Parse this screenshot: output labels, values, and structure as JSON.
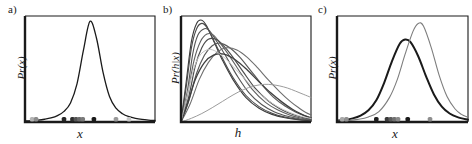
{
  "figure": {
    "width": 472,
    "height": 144,
    "background": "#ffffff",
    "axis_color": "#1a1a1a"
  },
  "panels": [
    {
      "key": "a",
      "label": "a)",
      "xlabel": "x",
      "ylabel": "Pr(x)"
    },
    {
      "key": "b",
      "label": "b)",
      "xlabel": "h",
      "ylabel": "Pr(h|x)"
    },
    {
      "key": "c",
      "label": "c)",
      "xlabel": "x",
      "ylabel": "Pr(x)"
    }
  ],
  "chart_data": [
    {
      "type": "line",
      "panel": "a",
      "title": "a)",
      "xlabel": "x",
      "ylabel": "Pr(x)",
      "xlim": [
        0,
        1
      ],
      "ylim": [
        0,
        1
      ],
      "grid": false,
      "legend": "none",
      "series": [
        {
          "name": "marginal-density",
          "color": "#1a1a1a",
          "width": 1.3,
          "x": [
            0.0,
            0.05,
            0.1,
            0.15,
            0.2,
            0.25,
            0.3,
            0.35,
            0.4,
            0.45,
            0.5,
            0.55,
            0.6,
            0.65,
            0.7,
            0.75,
            0.8,
            0.85,
            0.9,
            0.95,
            1.0
          ],
          "y": [
            0.01,
            0.013,
            0.018,
            0.026,
            0.038,
            0.06,
            0.1,
            0.18,
            0.36,
            0.68,
            0.95,
            0.79,
            0.47,
            0.24,
            0.13,
            0.078,
            0.05,
            0.034,
            0.024,
            0.018,
            0.014
          ]
        }
      ],
      "rug_points": [
        {
          "x": 0.055,
          "shade": "#b4b4b4"
        },
        {
          "x": 0.085,
          "shade": "#8c8c8c"
        },
        {
          "x": 0.3,
          "shade": "#262626"
        },
        {
          "x": 0.365,
          "shade": "#2e2e2e"
        },
        {
          "x": 0.392,
          "shade": "#555555"
        },
        {
          "x": 0.418,
          "shade": "#6b6b6b"
        },
        {
          "x": 0.444,
          "shade": "#7a7a7a"
        },
        {
          "x": 0.53,
          "shade": "#1a1a1a"
        },
        {
          "x": 0.7,
          "shade": "#9a9a9a"
        },
        {
          "x": 0.8,
          "shade": "#c8c8c8"
        }
      ]
    },
    {
      "type": "line",
      "panel": "b",
      "title": "b)",
      "xlabel": "h",
      "ylabel": "Pr(h|x)",
      "xlim": [
        0,
        1
      ],
      "ylim": [
        0,
        1
      ],
      "grid": false,
      "legend": "none",
      "series": [
        {
          "name": "posterior-1",
          "color": "#3c3c3c",
          "width": 1.1,
          "x": [
            0.0,
            0.04,
            0.08,
            0.12,
            0.16,
            0.2,
            0.26,
            0.32,
            0.4,
            0.5,
            0.6,
            0.7,
            0.8,
            0.9,
            1.0
          ],
          "y": [
            0.0,
            0.38,
            0.76,
            0.93,
            0.96,
            0.9,
            0.74,
            0.58,
            0.4,
            0.23,
            0.13,
            0.072,
            0.04,
            0.022,
            0.012
          ]
        },
        {
          "name": "posterior-2",
          "color": "#4a4a4a",
          "width": 1.1,
          "x": [
            0.0,
            0.04,
            0.08,
            0.12,
            0.16,
            0.2,
            0.26,
            0.32,
            0.4,
            0.5,
            0.6,
            0.7,
            0.8,
            0.9,
            1.0
          ],
          "y": [
            0.0,
            0.33,
            0.7,
            0.88,
            0.93,
            0.89,
            0.75,
            0.6,
            0.42,
            0.25,
            0.145,
            0.082,
            0.046,
            0.026,
            0.014
          ]
        },
        {
          "name": "posterior-3",
          "color": "#555555",
          "width": 1.1,
          "x": [
            0.0,
            0.05,
            0.09,
            0.13,
            0.18,
            0.22,
            0.28,
            0.35,
            0.43,
            0.52,
            0.62,
            0.72,
            0.82,
            0.91,
            1.0
          ],
          "y": [
            0.0,
            0.3,
            0.64,
            0.82,
            0.88,
            0.86,
            0.75,
            0.61,
            0.44,
            0.28,
            0.165,
            0.095,
            0.054,
            0.031,
            0.018
          ]
        },
        {
          "name": "posterior-4",
          "color": "#606060",
          "width": 1.1,
          "x": [
            0.0,
            0.05,
            0.1,
            0.15,
            0.2,
            0.25,
            0.31,
            0.38,
            0.46,
            0.55,
            0.65,
            0.75,
            0.84,
            0.92,
            1.0
          ],
          "y": [
            0.0,
            0.26,
            0.58,
            0.76,
            0.83,
            0.82,
            0.73,
            0.61,
            0.46,
            0.305,
            0.185,
            0.11,
            0.064,
            0.038,
            0.022
          ]
        },
        {
          "name": "posterior-5",
          "color": "#4e4e4e",
          "width": 1.2,
          "x": [
            0.0,
            0.06,
            0.11,
            0.16,
            0.21,
            0.27,
            0.33,
            0.4,
            0.48,
            0.57,
            0.67,
            0.76,
            0.85,
            0.93,
            1.0
          ],
          "y": [
            0.0,
            0.24,
            0.53,
            0.7,
            0.78,
            0.78,
            0.715,
            0.61,
            0.47,
            0.32,
            0.2,
            0.125,
            0.075,
            0.045,
            0.027
          ]
        },
        {
          "name": "posterior-6",
          "color": "#5a5a5a",
          "width": 1.2,
          "x": [
            0.0,
            0.06,
            0.12,
            0.18,
            0.24,
            0.3,
            0.37,
            0.45,
            0.53,
            0.62,
            0.71,
            0.8,
            0.88,
            0.95,
            1.0
          ],
          "y": [
            0.0,
            0.2,
            0.46,
            0.63,
            0.72,
            0.745,
            0.705,
            0.615,
            0.495,
            0.355,
            0.235,
            0.15,
            0.095,
            0.06,
            0.042
          ]
        },
        {
          "name": "posterior-7",
          "color": "#6e6e6e",
          "width": 1.1,
          "x": [
            0.0,
            0.07,
            0.14,
            0.21,
            0.28,
            0.35,
            0.43,
            0.51,
            0.59,
            0.67,
            0.76,
            0.84,
            0.91,
            0.96,
            1.0
          ],
          "y": [
            0.0,
            0.17,
            0.4,
            0.56,
            0.66,
            0.7,
            0.68,
            0.61,
            0.51,
            0.4,
            0.285,
            0.195,
            0.13,
            0.09,
            0.068
          ]
        },
        {
          "name": "posterior-8",
          "color": "#3f3f3f",
          "width": 1.3,
          "x": [
            0.0,
            0.05,
            0.11,
            0.18,
            0.25,
            0.33,
            0.42,
            0.51,
            0.6,
            0.69,
            0.78,
            0.86,
            0.93,
            0.97,
            1.0
          ],
          "y": [
            0.0,
            0.17,
            0.4,
            0.56,
            0.63,
            0.64,
            0.585,
            0.49,
            0.38,
            0.275,
            0.185,
            0.118,
            0.072,
            0.05,
            0.038
          ]
        },
        {
          "name": "posterior-broad",
          "color": "#9c9c9c",
          "width": 1.0,
          "x": [
            0.0,
            0.08,
            0.16,
            0.24,
            0.32,
            0.4,
            0.48,
            0.56,
            0.64,
            0.7,
            0.76,
            0.82,
            0.88,
            0.94,
            1.0
          ],
          "y": [
            0.0,
            0.035,
            0.08,
            0.135,
            0.195,
            0.255,
            0.305,
            0.34,
            0.355,
            0.352,
            0.34,
            0.32,
            0.292,
            0.262,
            0.232
          ]
        },
        {
          "name": "posterior-faint",
          "color": "#c4c4c4",
          "width": 1.0,
          "x": [
            0.0,
            0.04,
            0.09,
            0.14,
            0.2,
            0.26,
            0.34,
            0.42,
            0.51,
            0.6,
            0.7,
            0.79,
            0.88,
            0.95,
            1.0
          ],
          "y": [
            0.0,
            0.21,
            0.47,
            0.62,
            0.68,
            0.672,
            0.6,
            0.498,
            0.38,
            0.272,
            0.178,
            0.115,
            0.07,
            0.046,
            0.034
          ]
        }
      ]
    },
    {
      "type": "line",
      "panel": "c",
      "title": "c)",
      "xlabel": "x",
      "ylabel": "Pr(x)",
      "xlim": [
        0,
        1
      ],
      "ylim": [
        0,
        1
      ],
      "grid": false,
      "legend": "none",
      "series": [
        {
          "name": "predictive-dark",
          "color": "#1a1a1a",
          "width": 2.0,
          "x": [
            0.0,
            0.06,
            0.12,
            0.18,
            0.24,
            0.3,
            0.36,
            0.42,
            0.48,
            0.52,
            0.56,
            0.62,
            0.68,
            0.74,
            0.8,
            0.86,
            0.92,
            1.0
          ],
          "y": [
            0.012,
            0.02,
            0.034,
            0.06,
            0.11,
            0.205,
            0.37,
            0.575,
            0.74,
            0.778,
            0.755,
            0.62,
            0.43,
            0.26,
            0.145,
            0.08,
            0.046,
            0.022
          ]
        },
        {
          "name": "predictive-gray",
          "color": "#7d7d7d",
          "width": 1.1,
          "x": [
            0.0,
            0.08,
            0.16,
            0.24,
            0.32,
            0.4,
            0.46,
            0.52,
            0.58,
            0.62,
            0.66,
            0.72,
            0.78,
            0.84,
            0.9,
            0.95,
            1.0
          ],
          "y": [
            0.008,
            0.014,
            0.025,
            0.048,
            0.098,
            0.23,
            0.4,
            0.64,
            0.855,
            0.93,
            0.905,
            0.7,
            0.44,
            0.24,
            0.125,
            0.072,
            0.044
          ]
        }
      ],
      "rug_points": [
        {
          "x": 0.04,
          "shade": "#a8a8a8"
        },
        {
          "x": 0.072,
          "shade": "#909090"
        },
        {
          "x": 0.3,
          "shade": "#1f1f1f"
        },
        {
          "x": 0.382,
          "shade": "#3a3a3a"
        },
        {
          "x": 0.41,
          "shade": "#5c5c5c"
        },
        {
          "x": 0.438,
          "shade": "#707070"
        },
        {
          "x": 0.466,
          "shade": "#8a8a8a"
        },
        {
          "x": 0.54,
          "shade": "#1a1a1a"
        },
        {
          "x": 0.71,
          "shade": "#8e8e8e"
        }
      ]
    }
  ]
}
